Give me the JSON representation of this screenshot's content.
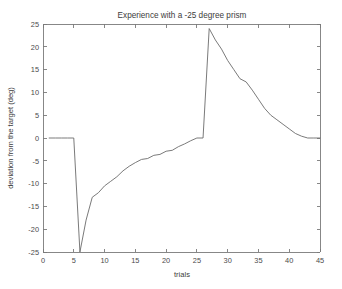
{
  "chart_data": {
    "type": "line",
    "title": "Experience with a -25 degree prism",
    "xlabel": "trials",
    "ylabel": "deviation from the target (deg)",
    "xlim": [
      0,
      45
    ],
    "ylim": [
      -25,
      25
    ],
    "xticks": [
      0,
      5,
      10,
      15,
      20,
      25,
      30,
      35,
      40,
      45
    ],
    "yticks": [
      -25,
      -20,
      -15,
      -10,
      -5,
      0,
      5,
      10,
      15,
      20,
      25
    ],
    "grid": false,
    "legend": null,
    "line_color": "#6b6b6b",
    "series": [
      {
        "name": "deviation",
        "x": [
          1,
          2,
          3,
          4,
          5,
          6,
          7,
          8,
          9,
          10,
          11,
          12,
          13,
          14,
          15,
          16,
          17,
          18,
          19,
          20,
          21,
          22,
          23,
          24,
          25,
          26,
          27,
          28,
          29,
          30,
          31,
          32,
          33,
          34,
          35,
          36,
          37,
          38,
          39,
          40,
          41,
          42,
          43,
          44,
          45
        ],
        "values": [
          0,
          0,
          0,
          0,
          0,
          -25,
          -18,
          -13,
          -12,
          -10.5,
          -9.5,
          -8.5,
          -7.2,
          -6.2,
          -5.4,
          -4.7,
          -4.5,
          -3.8,
          -3.6,
          -2.9,
          -2.7,
          -1.9,
          -1.3,
          -0.6,
          0,
          0,
          24,
          21.5,
          19.5,
          17,
          15,
          13,
          12.3,
          10.5,
          8.5,
          6.5,
          5,
          4,
          3,
          2,
          1,
          0.4,
          0,
          0,
          0
        ]
      }
    ]
  }
}
